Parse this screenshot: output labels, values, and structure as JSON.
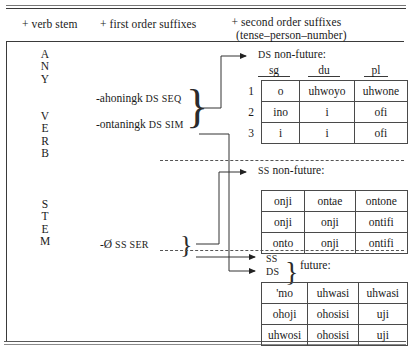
{
  "figure": {
    "columns": {
      "verb_stem": "+ verb stem",
      "first_order": "+ first order suffixes",
      "second_order_l1": "+ second order suffixes",
      "second_order_l2": "(tense–person–number)"
    },
    "stem_label": {
      "line1": "ANY",
      "line2": "VERB",
      "line3": "STEM",
      "letters_any": [
        "A",
        "N",
        "Y"
      ],
      "letters_verb": [
        "V",
        "E",
        "R",
        "B"
      ],
      "letters_stem": [
        "S",
        "T",
        "E",
        "M"
      ]
    },
    "first_order_suffixes": [
      {
        "form": "-ahoningk",
        "gloss": "DS SEQ"
      },
      {
        "form": "-ontaningk",
        "gloss": "DS SIM"
      },
      {
        "form": "-Ø",
        "gloss": "SS SER"
      }
    ],
    "paradigms": [
      {
        "id": "ds-nonfuture",
        "label": "DS non-future:",
        "label_sc": "DS",
        "label_rest": " non-future:",
        "column_headers": [
          "sg",
          "du",
          "pl"
        ],
        "row_numbers": [
          "1",
          "2",
          "3"
        ],
        "rows": [
          [
            "o",
            "uhwoyo",
            "uhwone"
          ],
          [
            "ino",
            "i",
            "ofi"
          ],
          [
            "i",
            "i",
            "ofi"
          ]
        ]
      },
      {
        "id": "ss-nonfuture",
        "label": "SS non-future:",
        "label_sc": "SS",
        "label_rest": " non-future:",
        "column_headers": [],
        "row_numbers": [],
        "rows": [
          [
            "onji",
            "ontae",
            "ontone"
          ],
          [
            "onji",
            "onji",
            "ontifi"
          ],
          [
            "onto",
            "onji",
            "ontifi"
          ]
        ]
      },
      {
        "id": "future",
        "label": "future:",
        "label_sc": "",
        "label_rest": "future:",
        "branch_labels": [
          "SS",
          "DS"
        ],
        "column_headers": [],
        "row_numbers": [],
        "rows": [
          [
            "'mo",
            "uhwasi",
            "uhwasi"
          ],
          [
            "ohoji",
            "ohosisi",
            "uji"
          ],
          [
            "uhwosi",
            "ohosisi",
            "uji"
          ]
        ]
      }
    ],
    "colors": {
      "ink": "#1a1a1a",
      "rule": "#3a3a3a",
      "cell_border": "#4a4a4a",
      "dashed": "#555555"
    }
  }
}
